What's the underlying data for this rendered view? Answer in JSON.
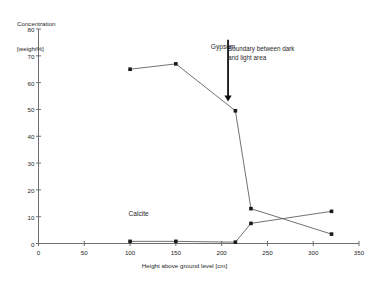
{
  "chart_data": {
    "type": "line",
    "title": "",
    "xlabel": "Height above ground level [cm]",
    "ylabel": "Concentration\n[weight%]",
    "ylabel_line1": "Concentration",
    "ylabel_line2": "[weight%]",
    "xlim": [
      0,
      350
    ],
    "ylim": [
      0,
      80
    ],
    "xticks": [
      0,
      50,
      100,
      150,
      200,
      250,
      300,
      350
    ],
    "yticks": [
      0,
      10,
      20,
      30,
      40,
      50,
      60,
      70,
      80
    ],
    "grid": false,
    "legend": "inline-labels",
    "series": [
      {
        "name": "Gypsum",
        "label_x": 210,
        "label_y": 73,
        "x": [
          100,
          150,
          215,
          232,
          320
        ],
        "values": [
          65,
          67,
          49.5,
          13,
          3.5
        ]
      },
      {
        "name": "Calcite",
        "label_x": 118,
        "label_y": 10.5,
        "x": [
          100,
          150,
          215,
          232,
          320
        ],
        "values": [
          0.8,
          0.8,
          0.5,
          7.5,
          12
        ]
      }
    ],
    "annotations": [
      {
        "name": "boundary-annotation",
        "text": "Boundary between dark\n and light area",
        "arrow_x": 207,
        "arrow_y_top": 76,
        "arrow_y_bottom": 53
      }
    ]
  }
}
